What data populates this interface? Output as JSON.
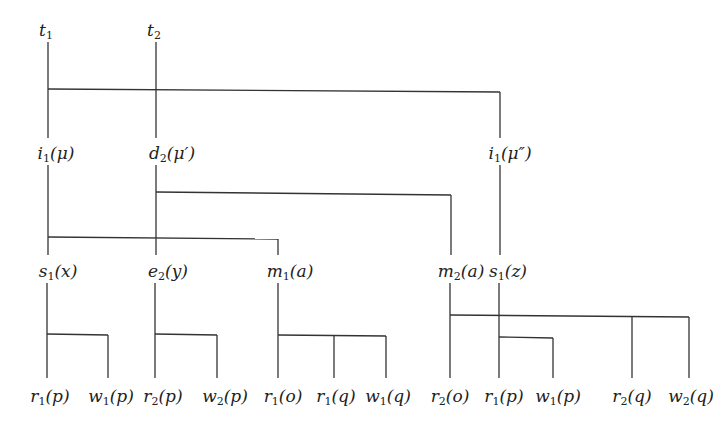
{
  "diagram": {
    "type": "transaction-tree",
    "roots": [
      {
        "id": "t1",
        "name": "t",
        "sub": "1",
        "arg": ""
      },
      {
        "id": "t2",
        "name": "t",
        "sub": "2",
        "arg": ""
      }
    ],
    "nodes": {
      "t1": {
        "name": "t",
        "sub": "1",
        "arg": "",
        "x": 48,
        "y": 30
      },
      "t2": {
        "name": "t",
        "sub": "2",
        "arg": "",
        "x": 156,
        "y": 30
      },
      "i1_mu": {
        "name": "i",
        "sub": "1",
        "arg": "(μ)",
        "x": 56,
        "y": 147
      },
      "d2_mu1": {
        "name": "d",
        "sub": "2",
        "arg": "(μ′)",
        "x": 172,
        "y": 147
      },
      "i1_mu2": {
        "name": "i",
        "sub": "1",
        "arg": "(μ″)",
        "x": 508,
        "y": 147
      },
      "s1_x": {
        "name": "s",
        "sub": "1",
        "arg": "(x)",
        "x": 56,
        "y": 265
      },
      "e2_y": {
        "name": "e",
        "sub": "2",
        "arg": "(y)",
        "x": 168,
        "y": 265
      },
      "m1_a": {
        "name": "m",
        "sub": "1",
        "arg": "(a)",
        "x": 287,
        "y": 265
      },
      "m2_a": {
        "name": "m",
        "sub": "2",
        "arg": "(a)",
        "x": 461,
        "y": 265
      },
      "s1_z": {
        "name": "s",
        "sub": "1",
        "arg": "(z)",
        "x": 507,
        "y": 265
      },
      "r1_p_a": {
        "name": "r",
        "sub": "1",
        "arg": "(p)",
        "x": 48,
        "y": 388
      },
      "w1_p_a": {
        "name": "w",
        "sub": "1",
        "arg": "(p)",
        "x": 111,
        "y": 388
      },
      "r2_p": {
        "name": "r",
        "sub": "2",
        "arg": "(p)",
        "x": 163,
        "y": 388
      },
      "w2_p": {
        "name": "w",
        "sub": "2",
        "arg": "(p)",
        "x": 224,
        "y": 388
      },
      "r1_o": {
        "name": "r",
        "sub": "1",
        "arg": "(o)",
        "x": 283,
        "y": 388
      },
      "r1_q": {
        "name": "r",
        "sub": "1",
        "arg": "(q)",
        "x": 338,
        "y": 388
      },
      "w1_q": {
        "name": "w",
        "sub": "1",
        "arg": "(q)",
        "x": 389,
        "y": 388
      },
      "r2_o": {
        "name": "r",
        "sub": "2",
        "arg": "(o)",
        "x": 451,
        "y": 388
      },
      "r1_p_b": {
        "name": "r",
        "sub": "1",
        "arg": "(p)",
        "x": 505,
        "y": 388
      },
      "w1_p_b": {
        "name": "w",
        "sub": "1",
        "arg": "(p)",
        "x": 560,
        "y": 388
      },
      "r2_q": {
        "name": "r",
        "sub": "2",
        "arg": "(q)",
        "x": 632,
        "y": 388
      },
      "w2_q": {
        "name": "w",
        "sub": "2",
        "arg": "(q)",
        "x": 690,
        "y": 388
      }
    },
    "edges": [
      {
        "parent": "t1",
        "children": [
          "i1_mu",
          "i1_mu2"
        ]
      },
      {
        "parent": "t2",
        "children": [
          "d2_mu1"
        ]
      },
      {
        "parent": "i1_mu",
        "children": [
          "s1_x",
          "e2_y",
          "m1_a"
        ]
      },
      {
        "parent": "d2_mu1",
        "children": [
          "e2_y",
          "m2_a"
        ]
      },
      {
        "parent": "i1_mu2",
        "children": [
          "s1_z"
        ]
      },
      {
        "parent": "s1_x",
        "children": [
          "r1_p_a",
          "w1_p_a"
        ]
      },
      {
        "parent": "e2_y",
        "children": [
          "r2_p",
          "w2_p"
        ]
      },
      {
        "parent": "m1_a",
        "children": [
          "r1_o",
          "r1_q",
          "w1_q"
        ]
      },
      {
        "parent": "m2_a",
        "children": [
          "r2_o",
          "r1_p_b",
          "r2_q",
          "w2_q"
        ]
      },
      {
        "parent": "s1_z",
        "children": [
          "r1_p_b",
          "w1_p_b"
        ]
      }
    ]
  }
}
